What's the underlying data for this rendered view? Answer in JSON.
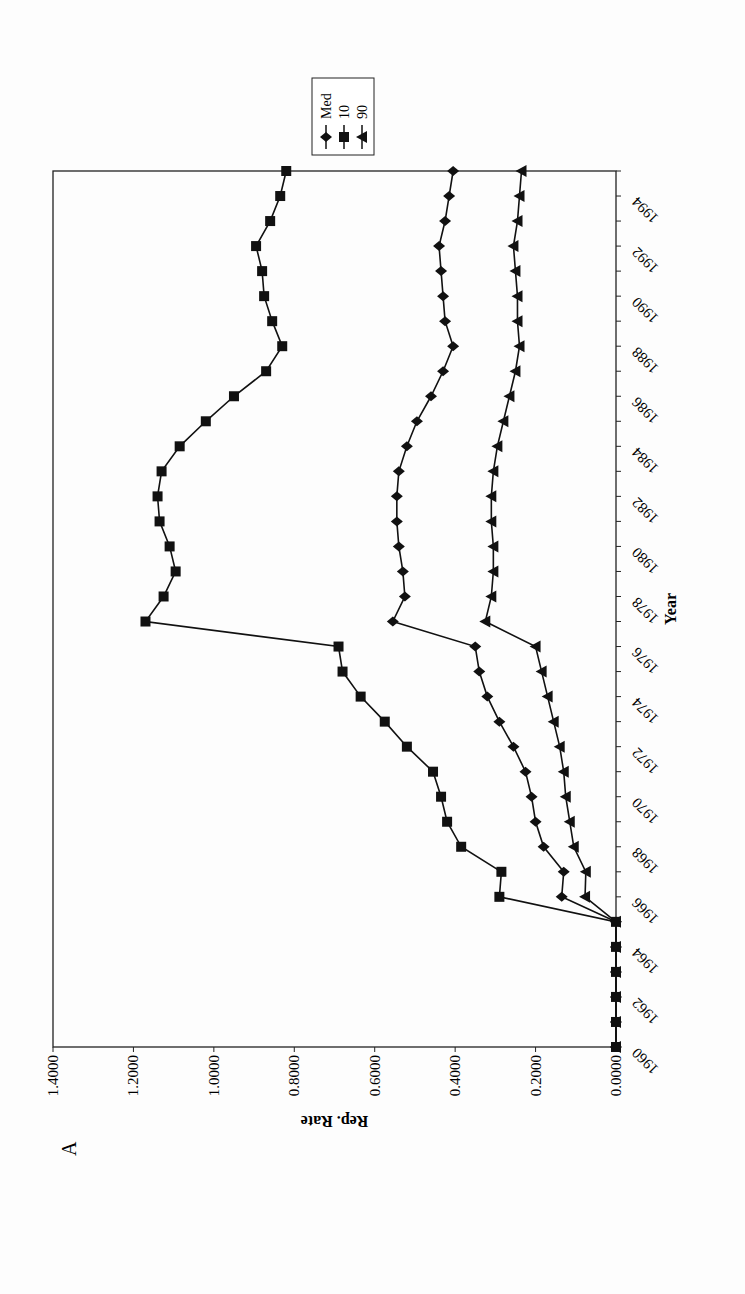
{
  "panel_label": "A",
  "chart_data": {
    "type": "line",
    "title": "",
    "xlabel": "Year",
    "ylabel": "Rep. Rate",
    "ylim": [
      0,
      1.4
    ],
    "yticks": [
      "0.0000",
      "0.2000",
      "0.4000",
      "0.6000",
      "0.8000",
      "1.0000",
      "1.2000",
      "1.4000"
    ],
    "xticks": [
      "1960",
      "1962",
      "1964",
      "1966",
      "1968",
      "1970",
      "1972",
      "1974",
      "1976",
      "1978",
      "1980",
      "1982",
      "1984",
      "1986",
      "1988",
      "1990",
      "1992",
      "1994"
    ],
    "grid": false,
    "legend_position": "right",
    "x": [
      1960,
      1961,
      1962,
      1963,
      1964,
      1965,
      1966,
      1967,
      1968,
      1969,
      1970,
      1971,
      1972,
      1973,
      1974,
      1975,
      1976,
      1977,
      1978,
      1979,
      1980,
      1981,
      1982,
      1983,
      1984,
      1985,
      1986,
      1987,
      1988,
      1989,
      1990,
      1991,
      1992,
      1993,
      1994,
      1995
    ],
    "series": [
      {
        "name": "Med",
        "marker": "diamond",
        "values": [
          0,
          0,
          0,
          0,
          0,
          0,
          0.135,
          0.13,
          0.18,
          0.2,
          0.21,
          0.225,
          0.255,
          0.29,
          0.32,
          0.34,
          0.35,
          0.555,
          0.525,
          0.53,
          0.54,
          0.545,
          0.545,
          0.54,
          0.52,
          0.495,
          0.46,
          0.43,
          0.405,
          0.425,
          0.43,
          0.435,
          0.44,
          0.425,
          0.415,
          0.405
        ]
      },
      {
        "name": "10",
        "marker": "square",
        "values": [
          0,
          0,
          0,
          0,
          0,
          0,
          0.29,
          0.285,
          0.385,
          0.42,
          0.435,
          0.455,
          0.52,
          0.575,
          0.635,
          0.68,
          0.69,
          1.17,
          1.125,
          1.095,
          1.11,
          1.135,
          1.14,
          1.13,
          1.085,
          1.02,
          0.95,
          0.87,
          0.83,
          0.855,
          0.875,
          0.88,
          0.895,
          0.86,
          0.835,
          0.82
        ]
      },
      {
        "name": "90",
        "marker": "triangle",
        "values": [
          0,
          0,
          0,
          0,
          0,
          0,
          0.077,
          0.075,
          0.105,
          0.115,
          0.125,
          0.13,
          0.14,
          0.155,
          0.17,
          0.185,
          0.2,
          0.325,
          0.31,
          0.305,
          0.305,
          0.31,
          0.31,
          0.305,
          0.295,
          0.28,
          0.265,
          0.25,
          0.24,
          0.245,
          0.245,
          0.25,
          0.255,
          0.245,
          0.24,
          0.235
        ]
      }
    ]
  }
}
